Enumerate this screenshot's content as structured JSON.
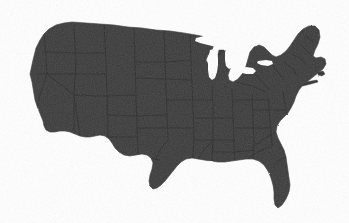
{
  "map": {
    "title": "United States of America",
    "subject": "contiguous-united-states",
    "projection": "albers-usa",
    "render_style": "filled-silhouette",
    "land_color": "#3c3c3c",
    "background_color": "#ffffff",
    "border_color": "#2a2a2a",
    "water_color": "#ffffff",
    "texture": "grain-noise",
    "labels_visible": false,
    "legend_visible": false,
    "graticule_visible": false,
    "width_px": 349,
    "height_px": 223,
    "extent": {
      "left_px": 28,
      "top_px": 22,
      "right_px": 326,
      "bottom_px": 208
    },
    "features": [
      {
        "name": "great-lakes",
        "kind": "water-cutout",
        "color": "#ffffff"
      },
      {
        "name": "state-boundaries",
        "kind": "internal-border",
        "color": "#2a2a2a"
      },
      {
        "name": "coastline",
        "kind": "outline",
        "color": "#3c3c3c"
      }
    ],
    "regions": [
      {
        "id": "pacific-northwest",
        "label": "Pacific Northwest"
      },
      {
        "id": "california",
        "label": "California"
      },
      {
        "id": "great-basin",
        "label": "Great Basin"
      },
      {
        "id": "southwest",
        "label": "Southwest"
      },
      {
        "id": "rocky-mountains",
        "label": "Rocky Mountains"
      },
      {
        "id": "great-plains",
        "label": "Great Plains"
      },
      {
        "id": "texas",
        "label": "Texas"
      },
      {
        "id": "midwest",
        "label": "Midwest"
      },
      {
        "id": "great-lakes-region",
        "label": "Great Lakes"
      },
      {
        "id": "northeast",
        "label": "Northeast"
      },
      {
        "id": "new-england",
        "label": "New England"
      },
      {
        "id": "mid-atlantic",
        "label": "Mid-Atlantic"
      },
      {
        "id": "southeast",
        "label": "Southeast"
      },
      {
        "id": "florida",
        "label": "Florida"
      },
      {
        "id": "gulf-coast",
        "label": "Gulf Coast"
      }
    ]
  }
}
